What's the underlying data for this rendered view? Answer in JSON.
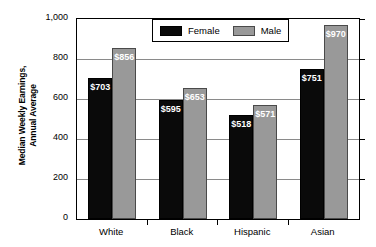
{
  "chart_data": {
    "type": "bar",
    "title": "",
    "xlabel": "",
    "ylabel": "Median Weekly Earnings, Annual Average",
    "ylabel_line1": "Median Weekly Earnings,",
    "ylabel_line2": "Annual Average",
    "categories": [
      "White",
      "Black",
      "Hispanic",
      "Asian"
    ],
    "series": [
      {
        "name": "Female",
        "color": "#0a0a0a",
        "values": [
          703,
          595,
          518,
          751
        ],
        "labels": [
          "$703",
          "$595",
          "$518",
          "$751"
        ]
      },
      {
        "name": "Male",
        "color": "#999999",
        "values": [
          856,
          653,
          571,
          970
        ],
        "labels": [
          "$856",
          "$653",
          "$571",
          "$970"
        ]
      }
    ],
    "ylim": [
      0,
      1000
    ],
    "yticks": [
      0,
      200,
      400,
      600,
      800,
      1000
    ],
    "ytick_labels": [
      "0",
      "200",
      "400",
      "600",
      "800",
      "1,000"
    ],
    "grid": true,
    "legend_position": "top-center",
    "legend_entries": [
      "Female",
      "Male"
    ]
  }
}
